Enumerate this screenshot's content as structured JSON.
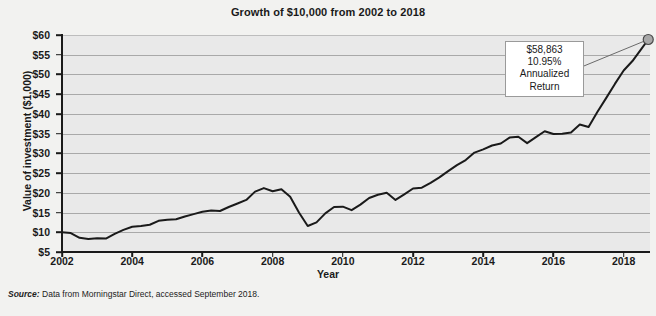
{
  "chart_data": {
    "type": "line",
    "title": "Growth of $10,000 from 2002 to 2018",
    "xlabel": "Year",
    "ylabel": "Value of investment ($1,000)",
    "xlim": [
      2002,
      2018.75
    ],
    "ylim": [
      5,
      60
    ],
    "grid": true,
    "legend_position": "none",
    "y_ticks": [
      "$60",
      "$55",
      "$50",
      "$45",
      "$40",
      "$35",
      "$30",
      "$25",
      "$20",
      "$15",
      "$10",
      "$5"
    ],
    "y_tick_values": [
      60,
      55,
      50,
      45,
      40,
      35,
      30,
      25,
      20,
      15,
      10,
      5
    ],
    "x_ticks": [
      "2002",
      "2004",
      "2006",
      "2008",
      "2010",
      "2012",
      "2014",
      "2016",
      "2018"
    ],
    "x_tick_values": [
      2002,
      2004,
      2006,
      2008,
      2010,
      2012,
      2014,
      2016,
      2018
    ],
    "series": [
      {
        "name": "Value of investment",
        "color": "#1a1a1a",
        "x": [
          2002.0,
          2002.25,
          2002.5,
          2002.75,
          2003.0,
          2003.25,
          2003.5,
          2003.75,
          2004.0,
          2004.25,
          2004.5,
          2004.75,
          2005.0,
          2005.25,
          2005.5,
          2005.75,
          2006.0,
          2006.25,
          2006.5,
          2006.75,
          2007.0,
          2007.25,
          2007.5,
          2007.75,
          2008.0,
          2008.25,
          2008.5,
          2008.75,
          2009.0,
          2009.25,
          2009.5,
          2009.75,
          2010.0,
          2010.25,
          2010.5,
          2010.75,
          2011.0,
          2011.25,
          2011.5,
          2011.75,
          2012.0,
          2012.25,
          2012.5,
          2012.75,
          2013.0,
          2013.25,
          2013.5,
          2013.75,
          2014.0,
          2014.25,
          2014.5,
          2014.75,
          2015.0,
          2015.25,
          2015.5,
          2015.75,
          2016.0,
          2016.25,
          2016.5,
          2016.75,
          2017.0,
          2017.25,
          2017.5,
          2017.75,
          2018.0,
          2018.25,
          2018.5,
          2018.7
        ],
        "values": [
          10.0,
          9.8,
          8.6,
          8.3,
          8.5,
          8.4,
          9.6,
          10.6,
          11.4,
          11.6,
          11.9,
          12.9,
          13.2,
          13.3,
          14.0,
          14.6,
          15.2,
          15.5,
          15.4,
          16.4,
          17.3,
          18.2,
          20.3,
          21.2,
          20.4,
          20.9,
          19.0,
          15.0,
          11.6,
          12.5,
          14.8,
          16.4,
          16.5,
          15.6,
          17.0,
          18.7,
          19.5,
          20.0,
          18.2,
          19.6,
          21.1,
          21.3,
          22.5,
          23.9,
          25.5,
          27.0,
          28.3,
          30.2,
          31.0,
          32.0,
          32.5,
          34.0,
          34.2,
          32.6,
          34.1,
          35.6,
          34.9,
          35.0,
          35.3,
          37.3,
          36.7,
          40.5,
          44.0,
          47.6,
          51.0,
          53.4,
          56.4,
          58.863
        ],
        "endpoint_marker": {
          "x": 2018.7,
          "y": 58.863,
          "color": "#a8a8a8",
          "edge": "#4a4a4a"
        }
      }
    ],
    "annotation": {
      "value": "$58,863",
      "rate": "10.95%",
      "line1": "Annualized",
      "line2": "Return"
    },
    "colors": {
      "plot_background": "#e9e9e9",
      "page_background": "#f2f2f0",
      "gridline": "#a9a9a9",
      "line": "#1a1a1a",
      "axis": "#1a1a1a",
      "annotation_background": "#ffffff",
      "annotation_border": "#9a9a9a"
    }
  },
  "source": {
    "label": "Source:",
    "text": "Data from Morningstar Direct, accessed September 2018."
  }
}
